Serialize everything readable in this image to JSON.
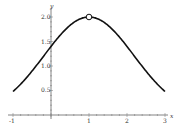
{
  "chart_data": {
    "type": "line",
    "title": "",
    "xlabel": "x",
    "ylabel": "y",
    "xlim": [
      -1,
      3
    ],
    "ylim": [
      0,
      2.1
    ],
    "x_ticks": [
      "-1",
      "1",
      "2",
      "3"
    ],
    "y_ticks": [
      "0.5",
      "1.0",
      "1.5",
      "2.0"
    ],
    "grid": false,
    "series": [
      {
        "name": "f(x)",
        "x": [
          -1,
          -0.5,
          0,
          0.5,
          1,
          1.5,
          2,
          2.5,
          3
        ],
        "values": [
          0.48,
          0.9,
          1.4,
          1.83,
          2.0,
          1.83,
          1.4,
          0.9,
          0.48
        ]
      }
    ],
    "annotations": [
      {
        "type": "open-circle",
        "x": 1,
        "y": 2.0,
        "label": "hole at peak"
      }
    ]
  },
  "labels": {
    "x_axis": "x",
    "y_axis": "y",
    "x_ticks": [
      "-1",
      "1",
      "2",
      "3"
    ],
    "y_ticks": [
      "0.5",
      "1.0",
      "1.5",
      "2.0"
    ]
  }
}
